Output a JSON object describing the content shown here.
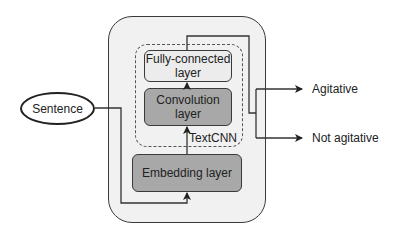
{
  "diagram": {
    "input": {
      "label": "Sentence"
    },
    "model_container": {
      "label": ""
    },
    "textcnn_group": {
      "label": "TextCNN"
    },
    "layers": {
      "fully_connected": {
        "line1": "Fully-connected",
        "line2": "layer"
      },
      "convolution": {
        "label": "Convolution layer"
      },
      "embedding": {
        "label": "Embedding layer"
      }
    },
    "outputs": [
      {
        "label": "Agitative"
      },
      {
        "label": "Not agitative"
      }
    ],
    "colors": {
      "container_fill": "#f1f1f1",
      "dark_layer_fill": "#a8a8a8",
      "light_layer_fill": "#ececec",
      "stroke": "#3a3a3a"
    },
    "edges": [
      {
        "from": "Sentence",
        "to": "Embedding layer"
      },
      {
        "from": "Embedding layer",
        "to": "Convolution layer"
      },
      {
        "from": "Convolution layer",
        "to": "Fully-connected layer"
      },
      {
        "from": "Fully-connected layer",
        "to": "Agitative"
      },
      {
        "from": "Fully-connected layer",
        "to": "Not agitative"
      }
    ]
  }
}
